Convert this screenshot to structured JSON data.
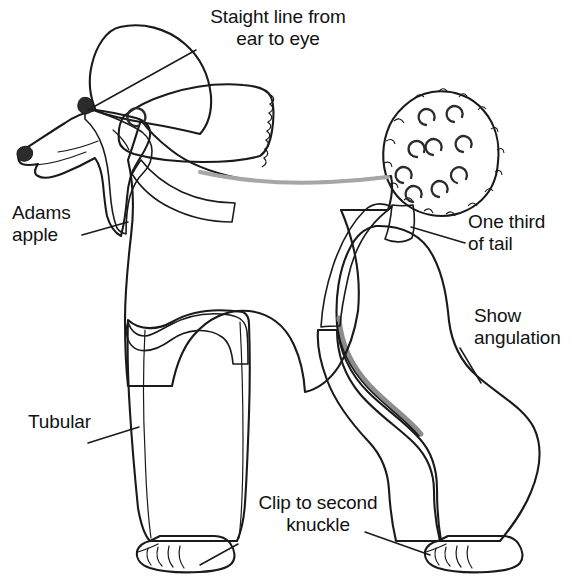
{
  "figure": {
    "view": "side profile, facing left"
  },
  "labels": {
    "ear_to_eye": "Staight line from\near to eye",
    "adams_apple": "Adams\napple",
    "tubular": "Tubular",
    "one_third_of_tail": "One third\nof tail",
    "show_angulation": "Show\nangulation",
    "clip_to_second_knuckle": "Clip to second\nknuckle"
  },
  "colors": {
    "background": "#ffffff",
    "outline": "#1a1a1a",
    "coat_light": "#c2c2c2",
    "coat_mid": "#b9b9b9",
    "coat_shadow": "#a8a8a8",
    "clipped_dark": "#8f8f8f",
    "clipped_darker": "#7e7e7e",
    "ear_white": "#fdfdfd",
    "eye": "#2a2a2a",
    "text": "#121212",
    "leader_line": "#1a1a1a"
  },
  "parts": {
    "topknot": "topknot",
    "face": "clipped face and muzzle",
    "eye": "eye",
    "nose": "nose",
    "ear": "ear",
    "neck": "clipped neck",
    "throat": "adams apple / throat line",
    "mane": "chest and mane coat",
    "front_leg_bracelet": "front leg bracelet",
    "shoulder_clip_band": "clipped shoulder band",
    "waist_clip_band": "clipped waist band",
    "hindquarter_pack": "hindquarter pack",
    "tail_pompom": "tail pompom",
    "tail_base": "clipped tail base",
    "front_foot": "clipped front foot",
    "hind_foot": "clipped hind foot"
  },
  "annotations": [
    {
      "id": "ear-eye",
      "text": "Staight line from ear to eye",
      "points_to": "eye"
    },
    {
      "id": "adams",
      "text": "Adams apple",
      "points_to": "throat"
    },
    {
      "id": "tubular",
      "text": "Tubular",
      "points_to": "front-leg"
    },
    {
      "id": "tail",
      "text": "One third of tail",
      "points_to": "tail-base"
    },
    {
      "id": "show",
      "text": "Show angulation",
      "points_to": "rear-angulation"
    },
    {
      "id": "clip-1",
      "text": "Clip to second knuckle",
      "points_to": "front-foot"
    },
    {
      "id": "clip-2",
      "text": "Clip to second knuckle",
      "points_to": "hind-foot"
    }
  ]
}
